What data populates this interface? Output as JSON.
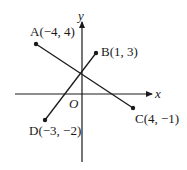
{
  "diagram": {
    "type": "coordinate-plane",
    "axes": {
      "x_label": "x",
      "y_label": "y",
      "origin_label": "O"
    },
    "points": [
      {
        "name": "A",
        "label": "A(−4, 4)",
        "x": -4,
        "y": 4
      },
      {
        "name": "B",
        "label": "B(1, 3)",
        "x": 1,
        "y": 3
      },
      {
        "name": "C",
        "label": "C(4, −1)",
        "x": 4,
        "y": -1
      },
      {
        "name": "D",
        "label": "D(−3, −2)",
        "x": -3,
        "y": -2
      }
    ],
    "segments": [
      {
        "from": "A",
        "to": "C"
      },
      {
        "from": "D",
        "to": "B"
      }
    ],
    "colors": {
      "ink": "#1a1a1a",
      "background": "#ffffff"
    }
  }
}
